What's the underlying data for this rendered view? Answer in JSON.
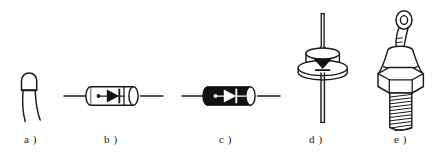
{
  "figure": {
    "background_color": "#ffffff",
    "ink_color": "#1b1b1b",
    "body_fill_black": "#111111",
    "body_fill_white": "#ffffff",
    "width": 437,
    "height": 161
  },
  "captions": {
    "a": "a )",
    "b": "b )",
    "c": "c )",
    "d": "d )",
    "e": "e )"
  },
  "items": [
    {
      "key": "a",
      "label": "a )",
      "name": "glass-bead-diode",
      "description": "Small rounded glass bead diode body with two thin parallel wire leads emerging downward",
      "icon": "glass-bead-diode-icon",
      "body_style": "outline",
      "lead_count": 2,
      "has_band": false,
      "has_symbol": false
    },
    {
      "key": "b",
      "label": "b )",
      "name": "clear-axial-diode",
      "description": "Clear glass axial cylindrical diode, white body, internal diode symbol with dot anode mark, cathode band, axial leads both sides",
      "icon": "clear-axial-diode-icon",
      "body_style": "outline",
      "lead_count": 2,
      "has_band": true,
      "has_symbol": true,
      "symbol": "diode-triangle-bar",
      "symbol_color": "#111111"
    },
    {
      "key": "c",
      "label": "c )",
      "name": "black-axial-diode",
      "description": "Black bodied axial cylindrical diode with white internal diode symbol, white dot mark, white cathode band and end cap, axial leads both sides",
      "icon": "black-axial-diode-icon",
      "body_style": "filled",
      "lead_count": 2,
      "has_band": true,
      "has_symbol": true,
      "symbol": "diode-triangle-bar",
      "symbol_color": "#ffffff"
    },
    {
      "key": "d",
      "label": "d )",
      "name": "press-fit-disc-diode",
      "description": "Press-fit disc diode: cylindrical can on a round flange, thin lead out of the top and a thicker lead out of the bottom, black diode triangle symbol marked on the can",
      "icon": "press-fit-disc-diode-icon",
      "body_style": "outline",
      "lead_count": 2,
      "has_flange": true,
      "has_symbol": true,
      "symbol": "diode-triangle-bar",
      "symbol_color": "#111111"
    },
    {
      "key": "e",
      "label": "e )",
      "name": "stud-mount-diode",
      "description": "Stud mounted power diode: ring terminal flexible lead on top, tapered ceramic body, hexagonal nut, threaded mounting stud below",
      "icon": "stud-mount-diode-icon",
      "body_style": "outline",
      "lead_count": 1,
      "has_hex_nut": true,
      "has_threaded_stud": true,
      "has_ring_terminal": true
    }
  ]
}
